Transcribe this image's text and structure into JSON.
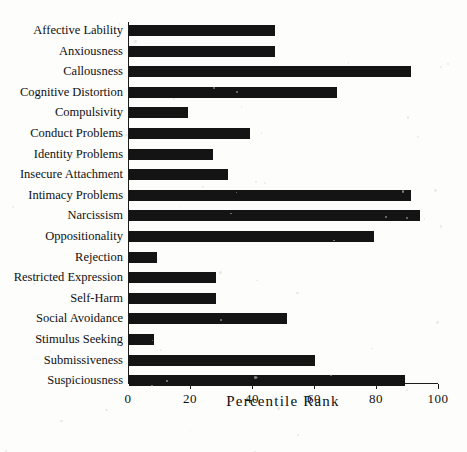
{
  "chart_data": {
    "type": "bar",
    "orientation": "horizontal",
    "title": "",
    "xlabel": "Percentile Rank",
    "ylabel": "",
    "xlim": [
      0,
      100
    ],
    "xticks": [
      0,
      20,
      40,
      60,
      80,
      100
    ],
    "xtick_labels": [
      "0",
      "20",
      "40",
      "60",
      "80",
      "100"
    ],
    "grid": false,
    "legend": false,
    "bar_color": "#141414",
    "axis_color": "#1a1a1a",
    "background_color": "#fdfdfc",
    "categories": [
      "Affective Lability",
      "Anxiousness",
      "Callousness",
      "Cognitive Distortion",
      "Compulsivity",
      "Conduct Problems",
      "Identity Problems",
      "Insecure Attachment",
      "Intimacy Problems",
      "Narcissism",
      "Oppositionality",
      "Rejection",
      "Restricted Expression",
      "Self-Harm",
      "Social Avoidance",
      "Stimulus Seeking",
      "Submissiveness",
      "Suspiciousness"
    ],
    "values": [
      47,
      47,
      91,
      67,
      19,
      39,
      27,
      32,
      91,
      94,
      79,
      9,
      28,
      28,
      51,
      8,
      60,
      89
    ]
  }
}
